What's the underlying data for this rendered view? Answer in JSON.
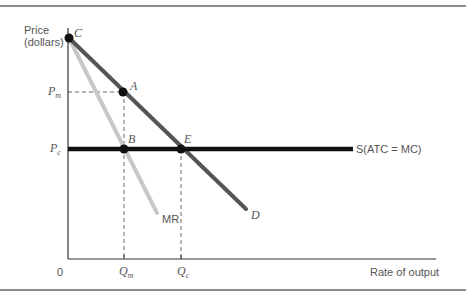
{
  "diagram": {
    "type": "economics-monopoly-vs-competition",
    "axes": {
      "y_label_line1": "Price",
      "y_label_line2": "(dollars)",
      "x_label": "Rate of output",
      "origin": "0"
    },
    "price_levels": {
      "pm": {
        "main": "P",
        "sub": "m"
      },
      "pc": {
        "main": "P",
        "sub": "c"
      }
    },
    "quantity_levels": {
      "qm": {
        "main": "Q",
        "sub": "m"
      },
      "qc": {
        "main": "Q",
        "sub": "c"
      }
    },
    "points": {
      "C": "C",
      "A": "A",
      "B": "B",
      "E": "E"
    },
    "curves": {
      "demand": "D",
      "marginal_revenue": "MR",
      "supply": "S(ATC = MC)"
    },
    "colors": {
      "demand": "#555555",
      "marginal_revenue": "#c8c8c8",
      "supply": "#111111",
      "axis": "#333333",
      "label": "#555555"
    }
  }
}
